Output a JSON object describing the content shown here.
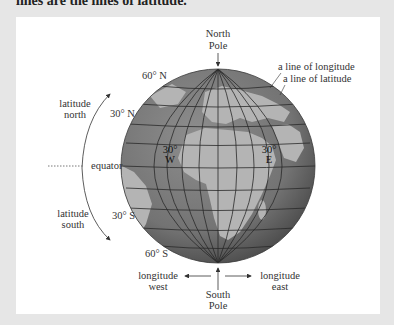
{
  "page": {
    "top_text": "lines are the lines of latitude."
  },
  "diagram": {
    "labels": {
      "north_pole": [
        "North",
        "Pole"
      ],
      "south_pole": [
        "South",
        "Pole"
      ],
      "line_of_longitude": "a line of longitude",
      "line_of_latitude": "a line of latitude",
      "latitude_north": [
        "latitude",
        "north"
      ],
      "latitude_south": [
        "latitude",
        "south"
      ],
      "equator": "equator",
      "lat_60n": "60° N",
      "lat_30n": "30° N",
      "lat_30s": "30° S",
      "lat_60s": "60° S",
      "lon_30w": [
        "30°",
        "W"
      ],
      "lon_30e": [
        "30°",
        "E"
      ],
      "longitude_west": [
        "longitude",
        "west"
      ],
      "longitude_east": [
        "longitude",
        "east"
      ]
    },
    "colors": {
      "ocean": "#7a7a7a",
      "land": "#b5b5b5",
      "grid": "#2a2a2a",
      "card": "#ffffff",
      "background": "#e6e6e6"
    }
  }
}
